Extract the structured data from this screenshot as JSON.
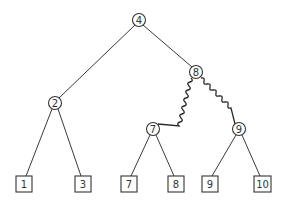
{
  "diagram": {
    "type": "binary-tree",
    "internal_nodes": [
      {
        "id": "n4",
        "label": "4",
        "x": 139,
        "y": 20
      },
      {
        "id": "n2",
        "label": "2",
        "x": 55,
        "y": 103
      },
      {
        "id": "n8",
        "label": "8",
        "x": 196,
        "y": 72
      },
      {
        "id": "n7",
        "label": "7",
        "x": 153,
        "y": 129
      },
      {
        "id": "n9",
        "label": "9",
        "x": 239,
        "y": 129
      }
    ],
    "leaves": [
      {
        "id": "l1",
        "label": "1",
        "x": 24,
        "y": 184
      },
      {
        "id": "l3",
        "label": "3",
        "x": 83,
        "y": 184
      },
      {
        "id": "l7",
        "label": "7",
        "x": 129,
        "y": 184
      },
      {
        "id": "l8",
        "label": "8",
        "x": 176,
        "y": 184
      },
      {
        "id": "l9",
        "label": "9",
        "x": 210,
        "y": 184
      },
      {
        "id": "l10",
        "label": "10",
        "x": 262,
        "y": 184
      }
    ],
    "edges": [
      {
        "from": "n4",
        "to": "n2",
        "style": "straight"
      },
      {
        "from": "n4",
        "to": "n8",
        "style": "straight"
      },
      {
        "from": "n2",
        "to": "l1",
        "style": "straight"
      },
      {
        "from": "n2",
        "to": "l3",
        "style": "straight"
      },
      {
        "from": "n8",
        "to": "n7",
        "style": "wavy"
      },
      {
        "from": "n8",
        "to": "n9",
        "style": "wavy"
      },
      {
        "from": "n7",
        "to": "l7",
        "style": "straight"
      },
      {
        "from": "n7",
        "to": "l8",
        "style": "straight"
      },
      {
        "from": "n9",
        "to": "l9",
        "style": "straight"
      },
      {
        "from": "n9",
        "to": "l10",
        "style": "straight"
      }
    ]
  }
}
